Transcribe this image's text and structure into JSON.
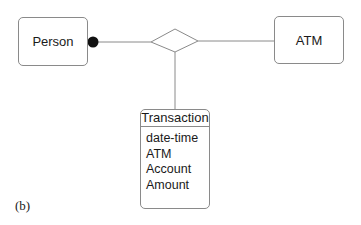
{
  "diagram": {
    "type": "entity-relationship",
    "entities": {
      "person": {
        "label": "Person"
      },
      "atm": {
        "label": "ATM"
      },
      "transaction": {
        "label": "Transaction",
        "attributes": [
          "date-time",
          "ATM",
          "Account",
          "Amount"
        ]
      }
    },
    "relationship": {
      "shape": "diamond",
      "connects": [
        "Person",
        "ATM",
        "Transaction"
      ]
    },
    "participation_marker": {
      "shape": "filled-circle",
      "at": "Person"
    },
    "caption": "(b)",
    "colors": {
      "line": "#8a8a8a",
      "marker": "#111111",
      "text": "#1a1a1a"
    }
  }
}
